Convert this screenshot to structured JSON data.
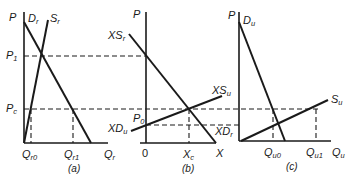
{
  "figure": {
    "panels": [
      {
        "id": "a",
        "caption": "(a)",
        "y_axis_label": "P",
        "x_axis_label": "Q",
        "x_axis_sub": "r",
        "curves": [
          {
            "name": "D",
            "sub": "r"
          },
          {
            "name": "S",
            "sub": "r"
          }
        ],
        "price_labels": [
          {
            "name": "P",
            "sub": "1"
          },
          {
            "name": "P",
            "sub": "c"
          }
        ],
        "quantity_labels": [
          {
            "name": "Q",
            "sub": "r0"
          },
          {
            "name": "Q",
            "sub": "r1"
          }
        ]
      },
      {
        "id": "b",
        "caption": "(b)",
        "y_axis_label": "P",
        "x_axis_label": "X",
        "origin_label": "0",
        "curves": [
          {
            "name": "XS",
            "sub": "r"
          },
          {
            "name": "XS",
            "sub": "u"
          },
          {
            "name": "XD",
            "sub": "u"
          },
          {
            "name": "XD",
            "sub": "r"
          }
        ],
        "price_labels": [
          {
            "name": "P",
            "sub": "0"
          }
        ],
        "quantity_labels": [
          {
            "name": "X",
            "sub": "c"
          }
        ]
      },
      {
        "id": "c",
        "caption": "(c)",
        "y_axis_label": "P",
        "x_axis_label": "Q",
        "x_axis_sub": "u",
        "curves": [
          {
            "name": "D",
            "sub": "u"
          },
          {
            "name": "S",
            "sub": "u"
          }
        ],
        "quantity_labels": [
          {
            "name": "Q",
            "sub": "u0"
          },
          {
            "name": "Q",
            "sub": "u1"
          }
        ]
      }
    ]
  }
}
